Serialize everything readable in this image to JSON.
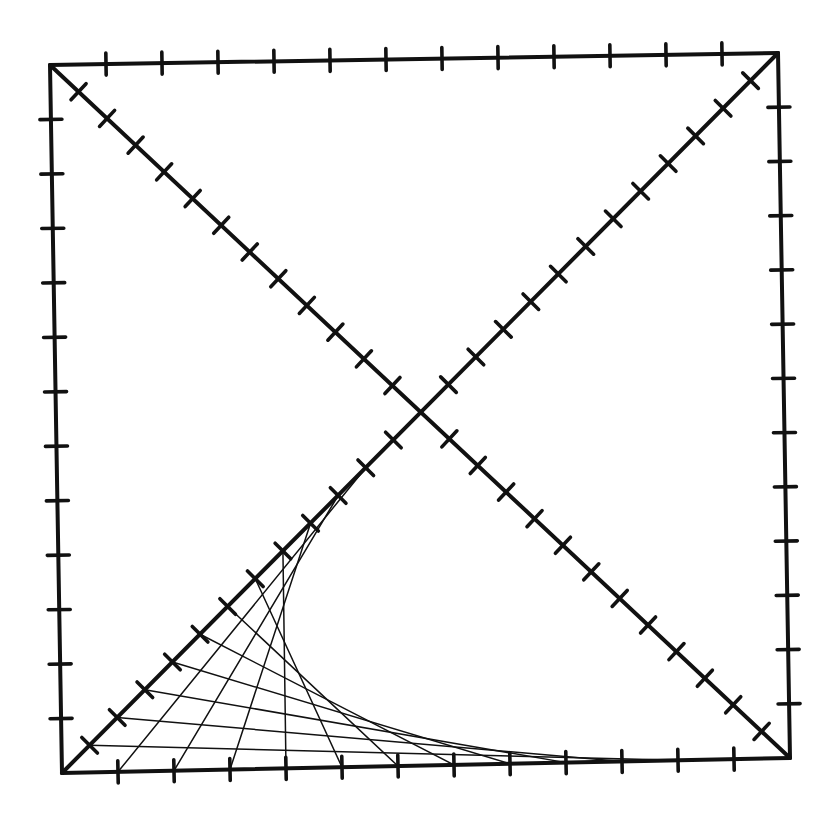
{
  "diagram": {
    "title": "",
    "ink_color": "#111111",
    "background_color": "#ffffff",
    "edge_divisions": 13,
    "half_diagonal_divisions": 13,
    "strings": {
      "from": "lower-left half-diagonal ticks",
      "to": "bottom edge ticks",
      "count": 11,
      "pairing": "diagonal tick k connects to bottom tick (12 - k)"
    }
  }
}
